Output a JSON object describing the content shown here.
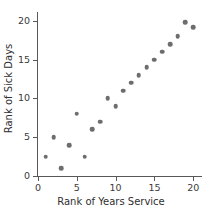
{
  "chart_data": {
    "type": "scatter",
    "title": "",
    "xlabel": "Rank of Years Service",
    "ylabel": "Rank of Sick Days",
    "xlim": [
      0,
      21
    ],
    "ylim": [
      0,
      21
    ],
    "xticks": [
      0,
      5,
      10,
      15,
      20
    ],
    "yticks": [
      0,
      5,
      10,
      15,
      20
    ],
    "xtick_labels": [
      "0",
      "5",
      "10",
      "15",
      "20"
    ],
    "ytick_labels": [
      "0",
      "5",
      "10",
      "15",
      "20"
    ],
    "grid": false,
    "legend": null,
    "marker_color": "#6d6d6d",
    "axis_color": "#585858",
    "series": [
      {
        "name": "Employees",
        "points": [
          {
            "x": 1,
            "y": 2.5
          },
          {
            "x": 2,
            "y": 5
          },
          {
            "x": 3,
            "y": 1
          },
          {
            "x": 4,
            "y": 4
          },
          {
            "x": 5,
            "y": 8
          },
          {
            "x": 6,
            "y": 2.5
          },
          {
            "x": 7,
            "y": 6
          },
          {
            "x": 8,
            "y": 7
          },
          {
            "x": 9,
            "y": 10
          },
          {
            "x": 10,
            "y": 9
          },
          {
            "x": 11,
            "y": 11
          },
          {
            "x": 12,
            "y": 12
          },
          {
            "x": 13,
            "y": 13
          },
          {
            "x": 14,
            "y": 14
          },
          {
            "x": 15,
            "y": 15
          },
          {
            "x": 16,
            "y": 16
          },
          {
            "x": 17,
            "y": 17
          },
          {
            "x": 18,
            "y": 18
          },
          {
            "x": 19,
            "y": 19.8
          },
          {
            "x": 20,
            "y": 19.2
          }
        ]
      }
    ]
  }
}
